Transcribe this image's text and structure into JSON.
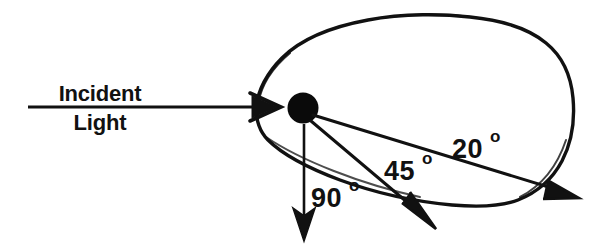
{
  "figure": {
    "background_color": "#ffffff",
    "ink_color": "#111111",
    "stroke_width_px": 3
  },
  "incident_beam": {
    "label_line_1": "Incident",
    "label_line_2": "Light",
    "arrow_start_x": 28,
    "arrow_end_x": 280,
    "arrow_y": 107
  },
  "particle": {
    "name": "scattering-particle",
    "center_x": 303,
    "center_y": 108,
    "radius": 15,
    "color": "#0a0a0a"
  },
  "envelope": {
    "name": "scattering-envelope",
    "description": "hand-drawn teardrop outline around particle"
  },
  "scattered_rays": [
    {
      "id": "ray-20",
      "label_number": "20",
      "label_degree": "o",
      "label_text": "20°",
      "label_x": 452,
      "label_y": 158,
      "tip_x": 578,
      "tip_y": 198
    },
    {
      "id": "ray-45",
      "label_number": "45",
      "label_degree": "o",
      "label_text": "45°",
      "label_x": 384,
      "label_y": 180,
      "tip_x": 435,
      "tip_y": 228
    },
    {
      "id": "ray-90",
      "label_number": "90",
      "label_degree": "o",
      "label_text": "90°",
      "label_x": 311,
      "label_y": 207,
      "tip_x": 305,
      "tip_y": 240
    }
  ]
}
